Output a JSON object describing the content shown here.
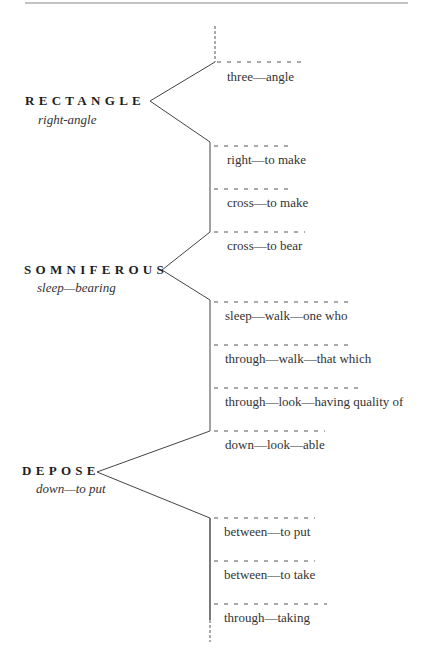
{
  "page": {
    "top_rule": true
  },
  "words": [
    {
      "word": "RECTANGLE",
      "gloss": "right-angle",
      "parts": [
        "three—angle",
        "right—to make",
        "cross—to make",
        "cross—to bear"
      ]
    },
    {
      "word": "SOMNIFEROUS",
      "gloss": "sleep—bearing",
      "parts": [
        "sleep—walk—one who",
        "through—walk—that which",
        "through—look—having quality of",
        "down—look—able"
      ]
    },
    {
      "word": "DEPOSE",
      "gloss": "down—to put",
      "parts": [
        "between—to put",
        "between—to take",
        "through—taking"
      ]
    }
  ],
  "colors": {
    "ink": "#2a2a2a",
    "line": "#444444",
    "dash": "#555555",
    "background": "#ffffff"
  }
}
